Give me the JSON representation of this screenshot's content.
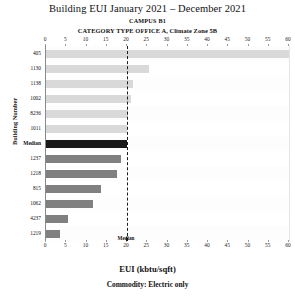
{
  "header": {
    "title": "Building EUI January 2021 – December 2021",
    "campus": "CAMPUS B1",
    "category": "CATEGORY TYPE OFFICE A, Climate Zone 5B"
  },
  "footer": {
    "x_title": "EUI (kbtu/sqft)",
    "commodity": "Commodity: Electric only"
  },
  "axis": {
    "y_title": "Building Number",
    "median_label": "Median"
  },
  "chart_data": {
    "type": "bar",
    "orientation": "horizontal",
    "title": "Building EUI January 2021 – December 2021",
    "subtitle": "CAMPUS B1",
    "annotation": "CATEGORY TYPE OFFICE A, Climate Zone 5B",
    "xlabel": "EUI (kbtu/sqft)",
    "ylabel": "Building Number",
    "note": "Commodity: Electric only",
    "xlim": [
      0,
      60
    ],
    "xticks": [
      0,
      5,
      10,
      15,
      20,
      25,
      30,
      35,
      40,
      45,
      50,
      55,
      60
    ],
    "grid": true,
    "legend": "none",
    "median_value": 20,
    "median_line_label": "Median",
    "colors": {
      "above_median": "#d9d9d9",
      "median": "#1a1a1a",
      "below_median": "#808080"
    },
    "categories": [
      "405",
      "1130",
      "1138",
      "1002",
      "8236",
      "1011",
      "Median",
      "1237",
      "1218",
      "815",
      "1062",
      "4237",
      "1219"
    ],
    "values": [
      60.0,
      25.5,
      21.5,
      21.0,
      20.2,
      20.1,
      20.0,
      18.5,
      17.5,
      13.5,
      11.5,
      5.5,
      3.5
    ],
    "bars": [
      {
        "label": "405",
        "value": 60.0,
        "group": "above_median"
      },
      {
        "label": "1130",
        "value": 25.5,
        "group": "above_median"
      },
      {
        "label": "1138",
        "value": 21.5,
        "group": "above_median"
      },
      {
        "label": "1002",
        "value": 21.0,
        "group": "above_median"
      },
      {
        "label": "8236",
        "value": 20.2,
        "group": "above_median"
      },
      {
        "label": "1011",
        "value": 20.1,
        "group": "above_median"
      },
      {
        "label": "Median",
        "value": 20.0,
        "group": "median"
      },
      {
        "label": "1237",
        "value": 18.5,
        "group": "below_median"
      },
      {
        "label": "1218",
        "value": 17.5,
        "group": "below_median"
      },
      {
        "label": "815",
        "value": 13.5,
        "group": "below_median"
      },
      {
        "label": "1062",
        "value": 11.5,
        "group": "below_median"
      },
      {
        "label": "4237",
        "value": 5.5,
        "group": "below_median"
      },
      {
        "label": "1219",
        "value": 3.5,
        "group": "below_median"
      }
    ]
  }
}
